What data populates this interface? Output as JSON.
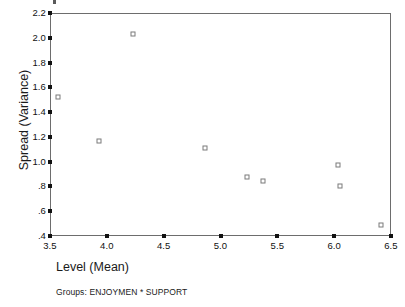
{
  "chart_data": {
    "type": "scatter",
    "title": "",
    "xlabel": "Level (Mean)",
    "ylabel": "Spread (Variance)",
    "footnote": "Groups: ENJOYMEN * SUPPORT",
    "xlim": [
      3.5,
      6.5
    ],
    "ylim": [
      0.4,
      2.2
    ],
    "xticks": [
      3.5,
      4.0,
      4.5,
      5.0,
      5.5,
      6.0,
      6.5
    ],
    "xtick_labels": [
      "3.5",
      "4.0",
      "4.5",
      "5.0",
      "5.5",
      "6.0",
      "6.5"
    ],
    "yticks": [
      0.4,
      0.6,
      0.8,
      1.0,
      1.2,
      1.4,
      1.6,
      1.8,
      2.0,
      2.2
    ],
    "ytick_labels": [
      ".4",
      ".6",
      ".8",
      "1.0",
      "1.2",
      "1.4",
      "1.6",
      "1.8",
      "2.0",
      "2.2"
    ],
    "grid": false,
    "legend": false,
    "marker": "open-square",
    "marker_color": "#7b7b7b",
    "frame_color": "#6d6d6d",
    "points": [
      {
        "x": 3.57,
        "y": 1.52
      },
      {
        "x": 3.93,
        "y": 1.17
      },
      {
        "x": 4.23,
        "y": 2.03
      },
      {
        "x": 4.86,
        "y": 1.11
      },
      {
        "x": 5.23,
        "y": 0.88
      },
      {
        "x": 5.37,
        "y": 0.84
      },
      {
        "x": 6.03,
        "y": 0.97
      },
      {
        "x": 6.05,
        "y": 0.8
      },
      {
        "x": 6.41,
        "y": 0.49
      }
    ]
  }
}
